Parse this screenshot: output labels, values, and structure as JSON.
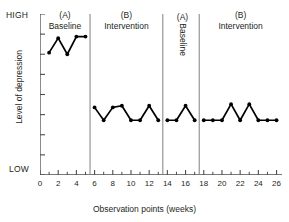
{
  "chart_data": {
    "type": "line",
    "title": "",
    "xlabel": "Observation points (weeks)",
    "ylabel": "Level of depression",
    "xlim": [
      0,
      26.6
    ],
    "ylim": [
      0,
      10
    ],
    "grid": false,
    "legend": "none",
    "y_axis_high_label": "HIGH",
    "y_axis_low_label": "LOW",
    "x_tick_labels": [
      "0",
      "2",
      "4",
      "6",
      "8",
      "10",
      "12",
      "14",
      "16",
      "18",
      "20",
      "22",
      "24",
      "26"
    ],
    "x_tick_values": [
      0,
      2,
      4,
      6,
      8,
      10,
      12,
      14,
      16,
      18,
      20,
      22,
      24,
      26
    ],
    "x_minor_ticks": [
      1,
      3,
      5,
      7,
      9,
      11,
      13,
      15,
      17,
      19,
      21,
      23,
      25
    ],
    "y_tick_count": 9,
    "phase_divider_x": [
      5.5,
      13.5,
      17.5
    ],
    "series": [
      {
        "name": "(A) Baseline 1",
        "x": [
          1,
          2,
          3,
          4,
          5
        ],
        "values": [
          7.6,
          8.5,
          7.5,
          8.6,
          8.6
        ]
      },
      {
        "name": "(B) Intervention 1",
        "x": [
          6,
          7,
          8,
          9,
          10,
          11,
          12,
          13
        ],
        "values": [
          4.2,
          3.4,
          4.2,
          4.3,
          3.4,
          3.4,
          4.3,
          3.4
        ]
      },
      {
        "name": "(A) Baseline 2",
        "x": [
          14,
          15,
          16,
          17
        ],
        "values": [
          3.4,
          3.4,
          4.3,
          3.4
        ]
      },
      {
        "name": "(B) Intervention 2",
        "x": [
          18,
          19,
          20,
          21,
          22,
          23,
          24,
          25,
          26
        ],
        "values": [
          3.4,
          3.4,
          3.4,
          4.4,
          3.4,
          4.4,
          3.4,
          3.4,
          3.4
        ]
      }
    ],
    "phases": [
      {
        "key": "a1",
        "letter": "(A)",
        "label": "Baseline",
        "x_start": 0.0,
        "x_end": 5.5,
        "orientation": "horizontal"
      },
      {
        "key": "b1",
        "letter": "(B)",
        "label": "Intervention",
        "x_start": 5.5,
        "x_end": 13.5,
        "orientation": "horizontal"
      },
      {
        "key": "a2",
        "letter": "(A)",
        "label": "Baseline",
        "x_start": 13.5,
        "x_end": 17.5,
        "orientation": "vertical"
      },
      {
        "key": "b2",
        "letter": "(B)",
        "label": "Intervention",
        "x_start": 17.5,
        "x_end": 26.6,
        "orientation": "horizontal"
      }
    ],
    "colors": {
      "line": "#000000",
      "marker": "#000000",
      "axis": "#4d4d4d",
      "divider": "#808080",
      "text": "#231f20",
      "background": "#ffffff"
    }
  }
}
